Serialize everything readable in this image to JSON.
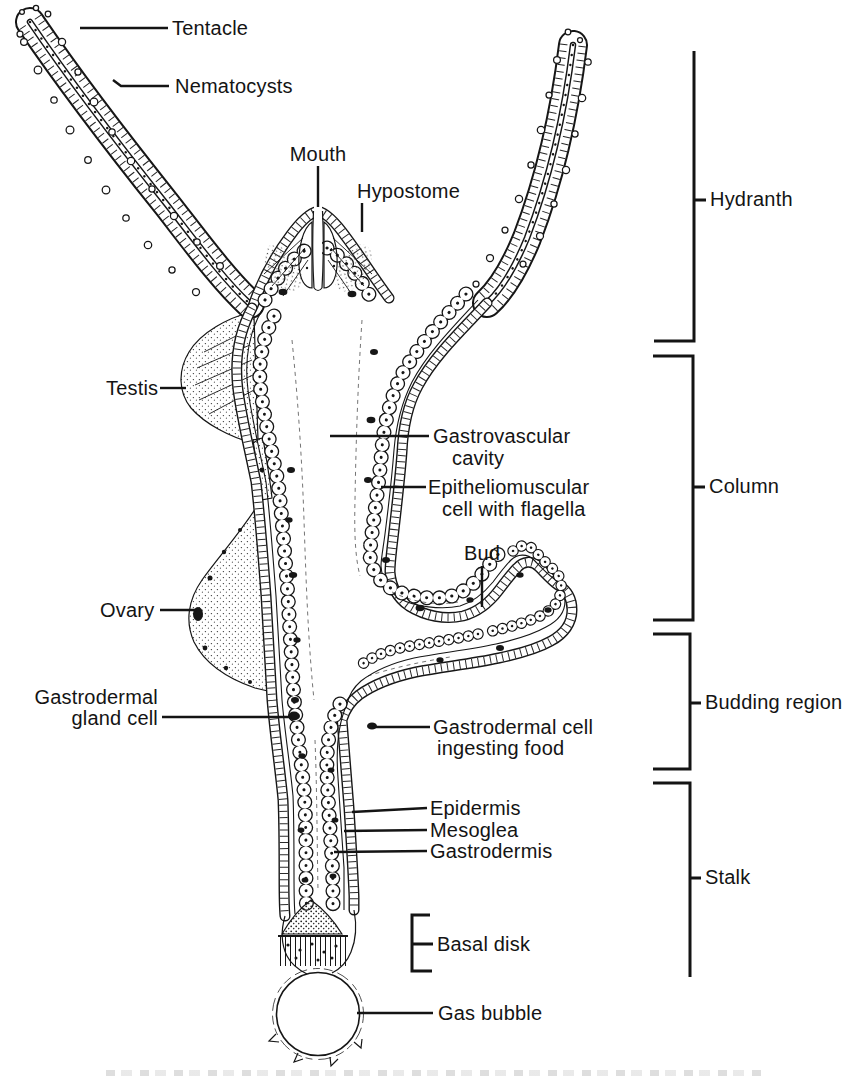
{
  "figure": {
    "kind": "anatomical-diagram",
    "colors": {
      "ink": "#141414",
      "paper": "#ffffff"
    }
  },
  "labels": {
    "tentacle": "Tentacle",
    "nematocysts": "Nematocysts",
    "mouth": "Mouth",
    "hypostome": "Hypostome",
    "testis": "Testis",
    "gastrovascular_line1": "Gastrovascular",
    "gastrovascular_line2": "cavity",
    "epitheliomuscular_line1": "Epitheliomuscular",
    "epitheliomuscular_line2": "cell with flagella",
    "bud": "Bud",
    "ovary": "Ovary",
    "gastrodermal_gland_line1": "Gastrodermal",
    "gastrodermal_gland_line2": "gland cell",
    "gastrodermal_cell_line1": "Gastrodermal cell",
    "gastrodermal_cell_line2": "ingesting food",
    "epidermis": "Epidermis",
    "mesoglea": "Mesoglea",
    "gastrodermis": "Gastrodermis",
    "basal_disk": "Basal disk",
    "gas_bubble": "Gas bubble"
  },
  "regions": {
    "hydranth": "Hydranth",
    "column": "Column",
    "budding_region": "Budding region",
    "stalk": "Stalk"
  }
}
